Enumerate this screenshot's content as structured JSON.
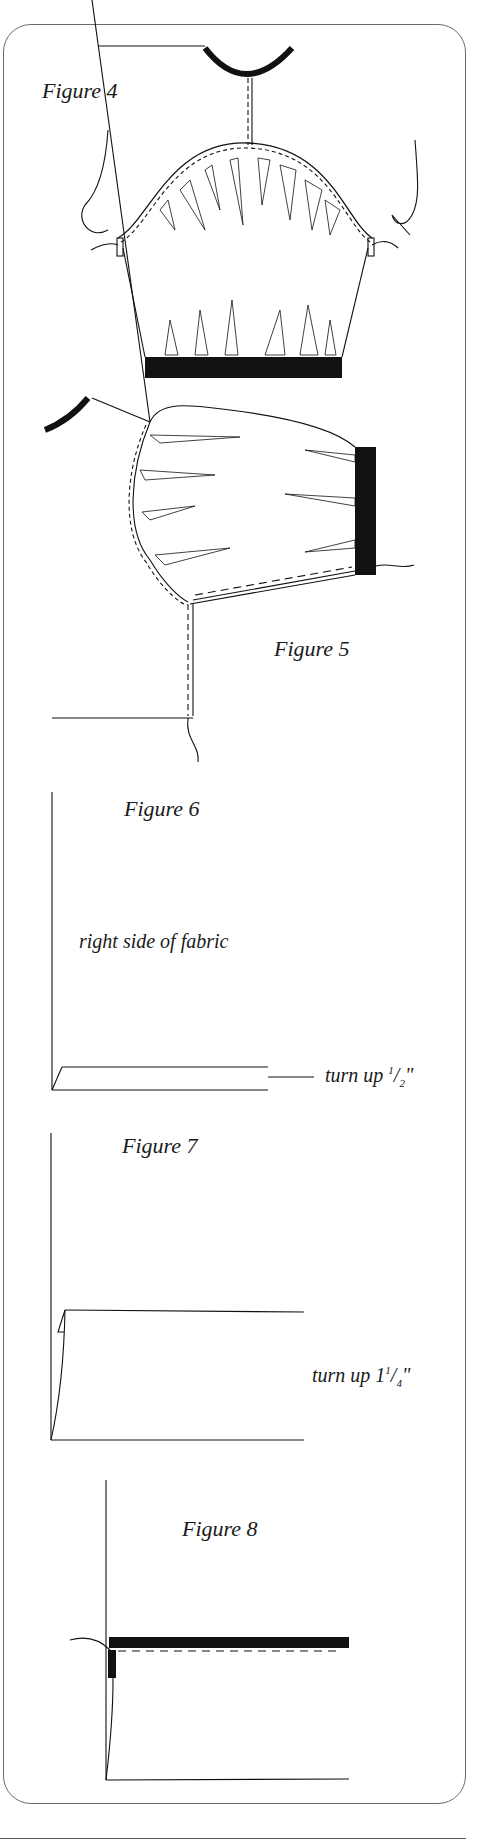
{
  "figures": [
    {
      "id": "figure-4",
      "caption": "Figure 4"
    },
    {
      "id": "figure-5",
      "caption": "Figure 5"
    },
    {
      "id": "figure-6",
      "caption": "Figure 6",
      "annotations": {
        "fabric_side": "right side of fabric",
        "turn_up_prefix": "turn up ",
        "turn_up_num": "1",
        "turn_up_den": "2",
        "turn_up_suffix": "\""
      }
    },
    {
      "id": "figure-7",
      "caption": "Figure 7",
      "annotations": {
        "turn_up_prefix": "turn up 1",
        "turn_up_num": "1",
        "turn_up_den": "4",
        "turn_up_suffix": "\""
      }
    },
    {
      "id": "figure-8",
      "caption": "Figure 8"
    }
  ],
  "colors": {
    "ink": "#111111",
    "frame": "#6a6a6a",
    "background": "#ffffff"
  }
}
